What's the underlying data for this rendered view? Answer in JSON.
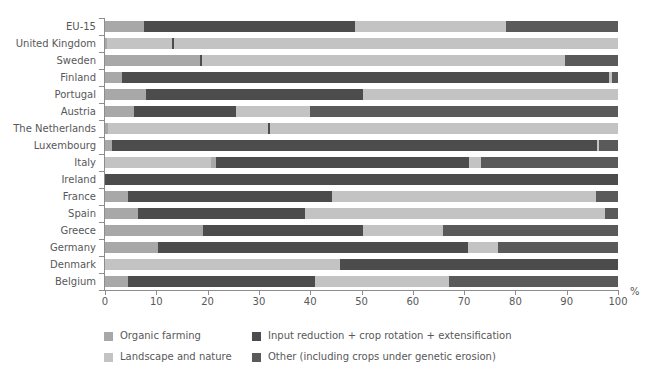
{
  "chart_data": {
    "type": "bar",
    "orientation": "horizontal",
    "stacked": true,
    "normalized": true,
    "title": "",
    "xlabel": "%",
    "ylabel": "",
    "xlim": [
      0,
      100
    ],
    "xticks": [
      0,
      10,
      20,
      30,
      40,
      50,
      60,
      70,
      80,
      90,
      100
    ],
    "grid": false,
    "legend_position": "bottom",
    "series": [
      {
        "name": "Organic farming",
        "color": "#a8a8a8"
      },
      {
        "name": "Landscape and nature",
        "color": "#c3c3c3"
      },
      {
        "name": "Input reduction + crop rotation + extensification",
        "color": "#4c4c4c"
      },
      {
        "name": "Other (including crops under genetic erosion)",
        "color": "#5a5a5a"
      }
    ],
    "categories": [
      "EU-15",
      "United Kingdom",
      "Sweden",
      "Finland",
      "Portugal",
      "Austria",
      "The Netherlands",
      "Luxembourg",
      "Italy",
      "Ireland",
      "France",
      "Spain",
      "Greece",
      "Germany",
      "Denmark",
      "Belgium"
    ],
    "rows": [
      {
        "category": "EU-15",
        "segments": [
          {
            "series": "Organic farming",
            "start": 0,
            "end": 7.6
          },
          {
            "series": "Input reduction + crop rotation + extensification",
            "start": 7.6,
            "end": 48.8
          },
          {
            "series": "Landscape and nature",
            "start": 48.8,
            "end": 78.2
          },
          {
            "series": "Other (including crops under genetic erosion)",
            "start": 78.2,
            "end": 100
          }
        ]
      },
      {
        "category": "United Kingdom",
        "segments": [
          {
            "series": "Organic farming",
            "start": 0,
            "end": 0.4
          },
          {
            "series": "Landscape and nature",
            "start": 0.4,
            "end": 13.0
          },
          {
            "series": "Input reduction + crop rotation + extensification",
            "start": 13.0,
            "end": 13.4
          },
          {
            "series": "Landscape and nature",
            "start": 13.4,
            "end": 100
          }
        ]
      },
      {
        "category": "Sweden",
        "segments": [
          {
            "series": "Organic farming",
            "start": 0,
            "end": 18.6
          },
          {
            "series": "Input reduction + crop rotation + extensification",
            "start": 18.6,
            "end": 19.0
          },
          {
            "series": "Landscape and nature",
            "start": 19.0,
            "end": 89.7
          },
          {
            "series": "Other (including crops under genetic erosion)",
            "start": 89.7,
            "end": 100
          }
        ]
      },
      {
        "category": "Finland",
        "segments": [
          {
            "series": "Organic farming",
            "start": 0,
            "end": 3.4
          },
          {
            "series": "Input reduction + crop rotation + extensification",
            "start": 3.4,
            "end": 98.2
          },
          {
            "series": "Landscape and nature",
            "start": 98.2,
            "end": 98.8
          },
          {
            "series": "Other (including crops under genetic erosion)",
            "start": 98.8,
            "end": 100
          }
        ]
      },
      {
        "category": "Portugal",
        "segments": [
          {
            "series": "Organic farming",
            "start": 0,
            "end": 8.0
          },
          {
            "series": "Input reduction + crop rotation + extensification",
            "start": 8.0,
            "end": 50.3
          },
          {
            "series": "Landscape and nature",
            "start": 50.3,
            "end": 100
          }
        ]
      },
      {
        "category": "Austria",
        "segments": [
          {
            "series": "Organic farming",
            "start": 0,
            "end": 5.6
          },
          {
            "series": "Input reduction + crop rotation + extensification",
            "start": 5.6,
            "end": 25.6
          },
          {
            "series": "Landscape and nature",
            "start": 25.6,
            "end": 39.9
          },
          {
            "series": "Other (including crops under genetic erosion)",
            "start": 39.9,
            "end": 100
          }
        ]
      },
      {
        "category": "The Netherlands",
        "segments": [
          {
            "series": "Organic farming",
            "start": 0,
            "end": 0.5
          },
          {
            "series": "Landscape and nature",
            "start": 0.5,
            "end": 31.8
          },
          {
            "series": "Input reduction + crop rotation + extensification",
            "start": 31.8,
            "end": 32.2
          },
          {
            "series": "Landscape and nature",
            "start": 32.2,
            "end": 100
          }
        ]
      },
      {
        "category": "Luxembourg",
        "segments": [
          {
            "series": "Organic farming",
            "start": 0,
            "end": 1.4
          },
          {
            "series": "Input reduction + crop rotation + extensification",
            "start": 1.4,
            "end": 95.9
          },
          {
            "series": "Landscape and nature",
            "start": 95.9,
            "end": 96.3
          },
          {
            "series": "Other (including crops under genetic erosion)",
            "start": 96.3,
            "end": 100
          }
        ]
      },
      {
        "category": "Italy",
        "segments": [
          {
            "series": "Landscape and nature",
            "start": 0,
            "end": 20.6
          },
          {
            "series": "Organic farming",
            "start": 20.6,
            "end": 21.6
          },
          {
            "series": "Input reduction + crop rotation + extensification",
            "start": 21.6,
            "end": 70.9
          },
          {
            "series": "Landscape and nature",
            "start": 70.9,
            "end": 73.2
          },
          {
            "series": "Other (including crops under genetic erosion)",
            "start": 73.2,
            "end": 100
          }
        ]
      },
      {
        "category": "Ireland",
        "segments": [
          {
            "series": "Input reduction + crop rotation + extensification",
            "start": 0,
            "end": 100
          }
        ]
      },
      {
        "category": "France",
        "segments": [
          {
            "series": "Organic farming",
            "start": 0,
            "end": 4.4
          },
          {
            "series": "Input reduction + crop rotation + extensification",
            "start": 4.4,
            "end": 44.2
          },
          {
            "series": "Landscape and nature",
            "start": 44.2,
            "end": 95.7
          },
          {
            "series": "Other (including crops under genetic erosion)",
            "start": 95.7,
            "end": 100
          }
        ]
      },
      {
        "category": "Spain",
        "segments": [
          {
            "series": "Organic farming",
            "start": 0,
            "end": 6.4
          },
          {
            "series": "Input reduction + crop rotation + extensification",
            "start": 6.4,
            "end": 39.0
          },
          {
            "series": "Landscape and nature",
            "start": 39.0,
            "end": 97.4
          },
          {
            "series": "Other (including crops under genetic erosion)",
            "start": 97.4,
            "end": 100
          }
        ]
      },
      {
        "category": "Greece",
        "segments": [
          {
            "series": "Organic farming",
            "start": 0,
            "end": 19.2
          },
          {
            "series": "Input reduction + crop rotation + extensification",
            "start": 19.2,
            "end": 50.2
          },
          {
            "series": "Landscape and nature",
            "start": 50.2,
            "end": 65.8
          },
          {
            "series": "Other (including crops under genetic erosion)",
            "start": 65.8,
            "end": 100
          }
        ]
      },
      {
        "category": "Germany",
        "segments": [
          {
            "series": "Organic farming",
            "start": 0,
            "end": 10.3
          },
          {
            "series": "Input reduction + crop rotation + extensification",
            "start": 10.3,
            "end": 70.8
          },
          {
            "series": "Landscape and nature",
            "start": 70.8,
            "end": 76.7
          },
          {
            "series": "Other (including crops under genetic erosion)",
            "start": 76.7,
            "end": 100
          }
        ]
      },
      {
        "category": "Denmark",
        "segments": [
          {
            "series": "Landscape and nature",
            "start": 0,
            "end": 45.8
          },
          {
            "series": "Input reduction + crop rotation + extensification",
            "start": 45.8,
            "end": 100
          }
        ]
      },
      {
        "category": "Belgium",
        "segments": [
          {
            "series": "Organic farming",
            "start": 0,
            "end": 4.5
          },
          {
            "series": "Input reduction + crop rotation + extensification",
            "start": 4.5,
            "end": 41.0
          },
          {
            "series": "Landscape and nature",
            "start": 41.0,
            "end": 67.0
          },
          {
            "series": "Other (including crops under genetic erosion)",
            "start": 67.0,
            "end": 100
          }
        ]
      }
    ],
    "legend": [
      "Organic farming",
      "Landscape and nature",
      "Input reduction + crop rotation + extensification",
      "Other (including crops under genetic erosion)"
    ]
  },
  "axis": {
    "x_unit": "%",
    "x_tick_labels": [
      "0",
      "10",
      "20",
      "30",
      "40",
      "50",
      "60",
      "70",
      "80",
      "90",
      "100"
    ]
  },
  "colors": {
    "organic": "#a8a8a8",
    "landscape": "#c3c3c3",
    "input_reduction": "#4c4c4c",
    "other": "#5a5a5a",
    "axis": "#8d8d8d",
    "text": "#58585a",
    "background": "#ffffff"
  }
}
